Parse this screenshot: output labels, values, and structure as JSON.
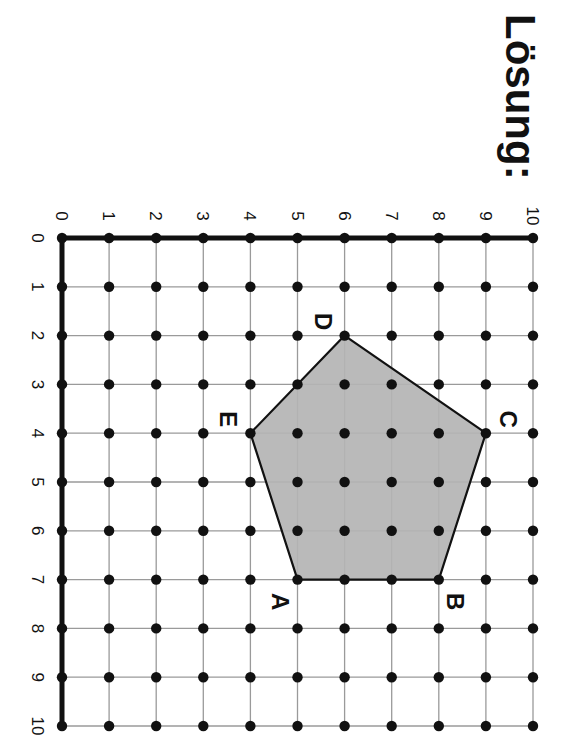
{
  "title": "Lösung:",
  "orientation_note": "page rotated 90deg clockwise",
  "colors": {
    "polygon_fill": "#b4b4b4",
    "polygon_stroke": "#111111",
    "grid": "#9a9a9a",
    "axis": "#111111",
    "dot": "#111111"
  },
  "axes": {
    "x_axis": {
      "label_values": [
        "0",
        "1",
        "2",
        "3",
        "4",
        "5",
        "6",
        "7",
        "8",
        "9",
        "10"
      ],
      "range": [
        0,
        10
      ]
    },
    "y_axis": {
      "label_values": [
        "0",
        "1",
        "2",
        "3",
        "4",
        "5",
        "6",
        "7",
        "8",
        "9",
        "10"
      ],
      "range": [
        0,
        10
      ]
    }
  },
  "polygon": {
    "name": "Pentagon ABCDE",
    "vertices": [
      {
        "label": "A",
        "x": 7,
        "y": 5
      },
      {
        "label": "B",
        "x": 7,
        "y": 8
      },
      {
        "label": "C",
        "x": 4,
        "y": 9
      },
      {
        "label": "D",
        "x": 2,
        "y": 6
      },
      {
        "label": "E",
        "x": 4,
        "y": 4
      }
    ]
  },
  "chart_data": {
    "type": "scatter",
    "title": "Lösung:",
    "xlabel": "",
    "ylabel": "",
    "xlim": [
      0,
      10
    ],
    "ylim": [
      0,
      10
    ],
    "grid": true,
    "x_ticks": [
      0,
      1,
      2,
      3,
      4,
      5,
      6,
      7,
      8,
      9,
      10
    ],
    "y_ticks": [
      0,
      1,
      2,
      3,
      4,
      5,
      6,
      7,
      8,
      9,
      10
    ],
    "series": [
      {
        "name": "Pentagon ABCDE (filled grey)",
        "points": [
          {
            "label": "A",
            "x": 7,
            "y": 5
          },
          {
            "label": "B",
            "x": 7,
            "y": 8
          },
          {
            "label": "C",
            "x": 4,
            "y": 9
          },
          {
            "label": "D",
            "x": 2,
            "y": 6
          },
          {
            "label": "E",
            "x": 4,
            "y": 4
          }
        ]
      }
    ],
    "annotations": [
      "A",
      "B",
      "C",
      "D",
      "E"
    ],
    "note": "Lattice of dots at every integer point 0..10 x 0..10; figure displayed rotated 90° clockwise"
  }
}
